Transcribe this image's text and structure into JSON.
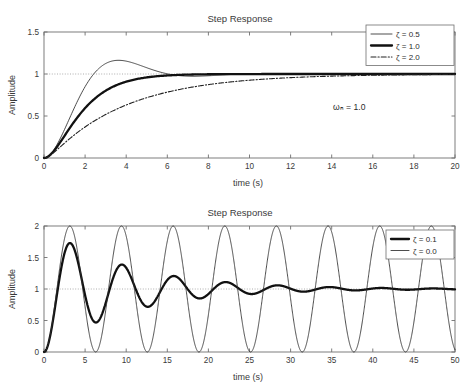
{
  "figures": [
    {
      "id": "top",
      "title": "Step Response",
      "xlabel": "time (s)",
      "ylabel": "Amplitude",
      "annotation": "ωₙ = 1.0",
      "annotation_x": 14.5,
      "annotation_y": 0.72,
      "legend": [
        {
          "label": "ζ = 0.5",
          "style": "thin"
        },
        {
          "label": "ζ = 1.0",
          "style": "thick"
        },
        {
          "label": "ζ = 2.0",
          "style": "dashdot"
        }
      ],
      "chart_data": {
        "type": "line",
        "title": "Step Response",
        "xlabel": "time (s)",
        "ylabel": "Amplitude",
        "xlim": [
          0,
          20
        ],
        "ylim": [
          0,
          1.5
        ],
        "xticks": [
          0,
          2,
          4,
          6,
          8,
          10,
          12,
          14,
          16,
          18,
          20
        ],
        "yticks": [
          0,
          0.5,
          1,
          1.5
        ],
        "xticklabels": [
          "0",
          "2",
          "4",
          "6",
          "8",
          "10",
          "12",
          "14",
          "16",
          "18",
          "20"
        ],
        "yticklabels": [
          "0",
          "0.5",
          "1",
          "1.5"
        ],
        "grid": false,
        "legend_position": "upper right",
        "reference_line": {
          "y": 1.0,
          "style": "dotted"
        },
        "annotations": [
          {
            "text": "ωₙ = 1.0",
            "x": 14.5,
            "y": 0.72
          }
        ],
        "natural_frequency": 1.0,
        "series": [
          {
            "name": "ζ = 0.5",
            "zeta": 0.5,
            "style": "thin",
            "x": [
              0,
              0.4,
              0.8,
              1.2,
              1.6,
              2,
              2.4,
              2.8,
              3.2,
              3.6,
              4,
              4.4,
              4.8,
              5.2,
              5.6,
              6,
              6.4,
              6.8,
              7.2,
              7.6,
              8,
              8.8,
              9.6,
              10.4,
              11.2,
              12,
              13,
              14,
              15,
              16,
              17,
              18,
              19,
              20
            ],
            "y": [
              0,
              0.0384,
              0.1333,
              0.2603,
              0.4001,
              0.5394,
              0.6688,
              0.7824,
              0.8772,
              0.9524,
              1.0087,
              1.0482,
              1.0735,
              1.0874,
              1.0926,
              1.0916,
              1.0864,
              1.0786,
              1.0696,
              1.0603,
              1.0513,
              1.0352,
              1.0227,
              1.0137,
              1.0075,
              1.0037,
              1.0011,
              0.9999,
              0.9996,
              0.9997,
              0.9999,
              1.0,
              1.0,
              1.0
            ]
          },
          {
            "name": "ζ = 1.0",
            "zeta": 1.0,
            "style": "thick",
            "x": [
              0,
              0.4,
              0.8,
              1.2,
              1.6,
              2,
              2.4,
              2.8,
              3.2,
              3.6,
              4,
              4.4,
              4.8,
              5.2,
              5.6,
              6,
              6.4,
              6.8,
              7.2,
              8,
              9,
              10,
              11,
              12,
              14,
              16,
              18,
              20
            ],
            "y": [
              0,
              0.0616,
              0.1912,
              0.3374,
              0.4751,
              0.594,
              0.6916,
              0.7689,
              0.8288,
              0.8743,
              0.9084,
              0.9335,
              0.9517,
              0.9648,
              0.9742,
              0.9826,
              0.9861,
              0.9891,
              0.9913,
              0.9941,
              0.9969,
              0.9995,
              0.9998,
              0.9999,
              1.0,
              1.0,
              1.0,
              1.0
            ]
          },
          {
            "name": "ζ = 2.0",
            "zeta": 2.0,
            "style": "dashdot",
            "x": [
              0,
              0.5,
              1,
              1.5,
              2,
              2.5,
              3,
              3.5,
              4,
              4.5,
              5,
              5.5,
              6,
              6.5,
              7,
              7.5,
              8,
              9,
              10,
              11,
              12,
              13,
              14,
              15,
              16,
              17,
              18,
              19,
              20
            ],
            "y": [
              0,
              0.0306,
              0.106,
              0.2024,
              0.3031,
              0.3997,
              0.4883,
              0.5672,
              0.6362,
              0.6959,
              0.747,
              0.7906,
              0.8275,
              0.8588,
              0.8852,
              0.9075,
              0.9262,
              0.9553,
              0.9748,
              0.9862,
              0.9923,
              0.9958,
              0.9977,
              0.9987,
              0.9993,
              0.9996,
              0.9998,
              0.9999,
              1.0
            ]
          }
        ]
      }
    },
    {
      "id": "bottom",
      "title": "Step Response",
      "xlabel": "time (s)",
      "ylabel": "Amplitude",
      "annotation": "",
      "legend": [
        {
          "label": "ζ = 0.1",
          "style": "thick"
        },
        {
          "label": "ζ = 0.0",
          "style": "thin"
        }
      ],
      "chart_data": {
        "type": "line",
        "title": "Step Response",
        "xlabel": "time (s)",
        "ylabel": "Amplitude",
        "xlim": [
          0,
          50
        ],
        "ylim": [
          0,
          2
        ],
        "xticks": [
          0,
          5,
          10,
          15,
          20,
          25,
          30,
          35,
          40,
          45,
          50
        ],
        "yticks": [
          0,
          0.5,
          1,
          1.5,
          2
        ],
        "xticklabels": [
          "0",
          "5",
          "10",
          "15",
          "20",
          "25",
          "30",
          "35",
          "40",
          "45",
          "50"
        ],
        "yticklabels": [
          "0",
          "0.5",
          "1",
          "1.5",
          "2"
        ],
        "grid": false,
        "legend_position": "upper right",
        "reference_line": {
          "y": 1.0,
          "style": "dotted"
        },
        "natural_frequency": 1.0,
        "series": [
          {
            "name": "ζ = 0.1",
            "zeta": 0.1,
            "style": "thick",
            "formula": "1 - exp(-0.1*t)*(cos(w*t) + (0.1/sqrt(0.99))*sin(w*t)), w = sqrt(0.99)",
            "peaks": [
              1.73,
              1.39,
              1.21,
              1.11,
              1.06,
              1.03,
              1.02
            ],
            "troughs": [
              0.47,
              0.72,
              0.84,
              0.91,
              0.95,
              0.97,
              0.98
            ]
          },
          {
            "name": "ζ = 0.0",
            "zeta": 0.0,
            "style": "thin",
            "formula": "1 - cos(t)",
            "amplitude_min": 0,
            "amplitude_max": 2,
            "period": 6.2832
          }
        ]
      }
    }
  ]
}
